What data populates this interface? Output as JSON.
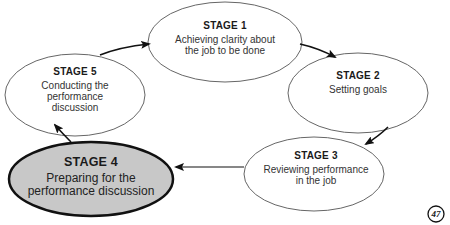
{
  "diagram": {
    "type": "cycle",
    "stages": [
      {
        "id": "stage-1",
        "title": "STAGE 1",
        "lines": [
          "Achieving clarity about",
          "the job to be done"
        ],
        "highlighted": false
      },
      {
        "id": "stage-2",
        "title": "STAGE 2",
        "lines": [
          "Setting goals"
        ],
        "highlighted": false
      },
      {
        "id": "stage-3",
        "title": "STAGE 3",
        "lines": [
          "Reviewing performance",
          "in the job"
        ],
        "highlighted": false
      },
      {
        "id": "stage-4",
        "title": "STAGE 4",
        "lines": [
          "Preparing for the",
          "performance discussion"
        ],
        "highlighted": true
      },
      {
        "id": "stage-5",
        "title": "STAGE 5",
        "lines": [
          "Conducting the",
          "performance",
          "discussion"
        ],
        "highlighted": false
      }
    ],
    "flow": [
      {
        "from": "stage-1",
        "to": "stage-2"
      },
      {
        "from": "stage-2",
        "to": "stage-3"
      },
      {
        "from": "stage-3",
        "to": "stage-4"
      },
      {
        "from": "stage-4",
        "to": "stage-5"
      },
      {
        "from": "stage-5",
        "to": "stage-1"
      }
    ],
    "colors": {
      "highlight_fill": "#c8c8c8",
      "stroke": "#555555",
      "arrow": "#111111"
    }
  },
  "page_number": "47"
}
